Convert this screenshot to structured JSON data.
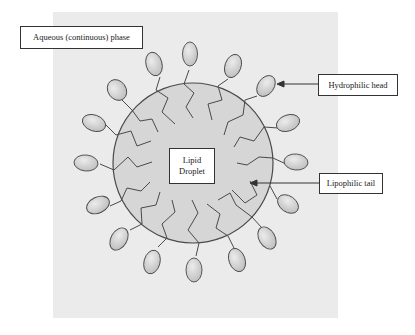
{
  "labels": {
    "aqueous_phase": "Aqueous (continuous) phase",
    "hydrophilic_head": "Hydrophilic head",
    "lipophilic_tail": "Lipophilic tail",
    "droplet_line1": "Lipid",
    "droplet_line2": "Droplet"
  },
  "colors": {
    "background_panel": "#ebebeb",
    "droplet_fill": "#d6d6d6",
    "head_fill": "#cfcfcf",
    "stroke": "#4a4a4a"
  },
  "diagram": {
    "center": [
      193,
      163
    ],
    "radius": 80,
    "head_count": 16
  }
}
